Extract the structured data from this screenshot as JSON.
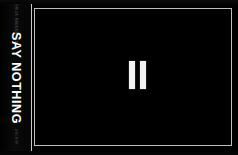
{
  "scene": {
    "kind": "book-cover-photo",
    "background_color": "#000000"
  },
  "spine": {
    "title": "SAY NOTHING",
    "author": "PATRICK RADDEN KEEFE",
    "publisher": "ANCHOR",
    "background_color": "#050505",
    "text_color": "#ffffff",
    "edge_color": "#c9c9c9"
  },
  "cover": {
    "background_color": "#000000",
    "border_color": "#bdbdbd",
    "glyph": {
      "name": "pause-icon",
      "bar_color": "#f2f2f2",
      "bar_count": "2"
    }
  }
}
